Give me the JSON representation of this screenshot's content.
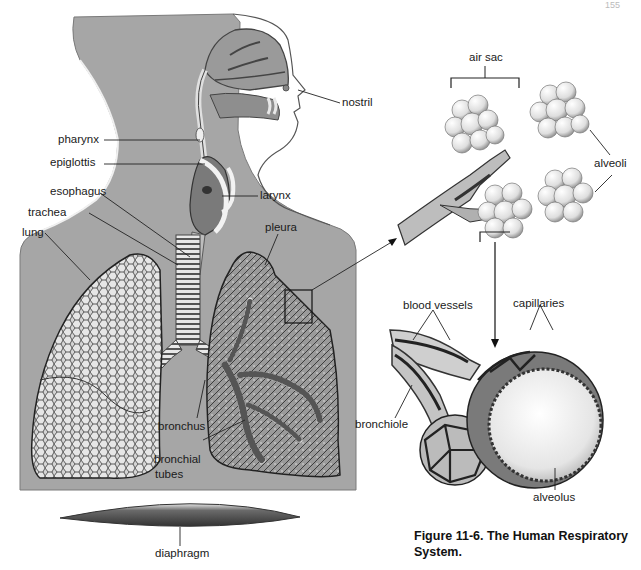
{
  "page": {
    "page_number_fragment": "155"
  },
  "figure": {
    "caption_line1": "Figure 11-6. The Human Respiratory",
    "caption_line2": "System."
  },
  "main_illustration": {
    "labels": {
      "nostril": "nostril",
      "pharynx": "pharynx",
      "epiglottis": "epiglottis",
      "larynx": "larynx",
      "esophagus": "esophagus",
      "trachea": "trachea",
      "lung": "lung",
      "pleura": "pleura",
      "bronchus": "bronchus",
      "bronchial_tubes_1": "bronchial",
      "bronchial_tubes_2": "tubes",
      "diaphragm": "diaphragm"
    }
  },
  "detail_air_sacs": {
    "labels": {
      "air_sac": "air sac",
      "alveoli": "alveoli"
    }
  },
  "detail_alveolus": {
    "labels": {
      "blood_vessels": "blood vessels",
      "capillaries": "capillaries",
      "bronchiole": "bronchiole",
      "alveolus": "alveolus"
    }
  },
  "colors": {
    "body_gray": "#a6a6a6",
    "ink": "#1a1a1a",
    "lung_fill": "#c9c9c9"
  }
}
